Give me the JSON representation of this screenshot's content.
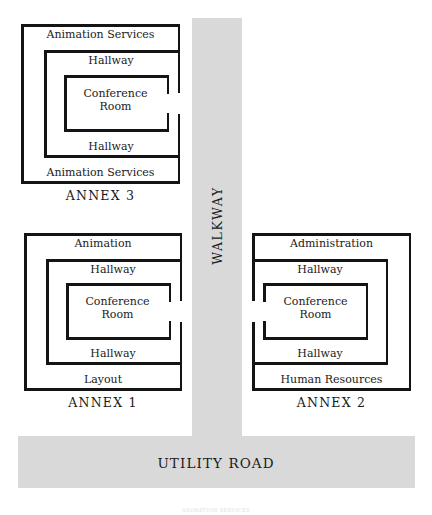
{
  "figure": {
    "footer_note": "ANIMATION SERVICES"
  },
  "colors": {
    "pavement": "#d9d9d9",
    "wall": "#141414",
    "text": "#1a1a1a",
    "background": "#ffffff"
  },
  "circulation": {
    "walkway": {
      "label": "WALKWAY",
      "orientation": "vertical"
    },
    "utility_road": {
      "label": "UTILITY ROAD",
      "orientation": "horizontal"
    }
  },
  "annexes": [
    {
      "id": "annex-3",
      "caption": "ANNEX 3",
      "door_side": "right",
      "rings": [
        {
          "level": "outer",
          "top_label": "Animation Services",
          "bottom_label": "Animation Services"
        },
        {
          "level": "middle",
          "top_label": "Hallway",
          "bottom_label": "Hallway"
        },
        {
          "level": "inner",
          "center_label_line1": "Conference",
          "center_label_line2": "Room"
        }
      ]
    },
    {
      "id": "annex-1",
      "caption": "ANNEX 1",
      "door_side": "right",
      "rings": [
        {
          "level": "outer",
          "top_label": "Animation",
          "bottom_label": "Layout"
        },
        {
          "level": "middle",
          "top_label": "Hallway",
          "bottom_label": "Hallway"
        },
        {
          "level": "inner",
          "center_label_line1": "Conference",
          "center_label_line2": "Room"
        }
      ]
    },
    {
      "id": "annex-2",
      "caption": "ANNEX 2",
      "door_side": "left",
      "rings": [
        {
          "level": "outer",
          "top_label": "Administration",
          "bottom_label": "Human Resources"
        },
        {
          "level": "middle",
          "top_label": "Hallway",
          "bottom_label": "Hallway"
        },
        {
          "level": "inner",
          "center_label_line1": "Conference",
          "center_label_line2": "Room"
        }
      ]
    }
  ]
}
